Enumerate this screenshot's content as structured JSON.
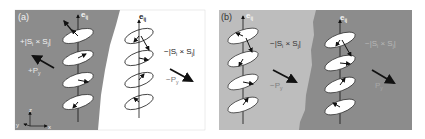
{
  "figure": {
    "panels": [
      {
        "id": "a",
        "label": "(a)",
        "axis_label": "e",
        "axis_sub": "ij",
        "left_region": {
          "color": "#8c8c8c",
          "chirality_label": "+|S",
          "chirality_sub1": "i",
          "chirality_mid": " × S",
          "chirality_sub2": "j",
          "chirality_end": "|",
          "polarization_label": "+P",
          "polarization_sub": "y"
        },
        "right_region": {
          "color": "#ffffff",
          "chirality_label": "−|S",
          "chirality_sub1": "i",
          "chirality_mid": " × S",
          "chirality_sub2": "j",
          "chirality_end": "|",
          "polarization_label": "−P",
          "polarization_sub": "y"
        },
        "axes": {
          "z": "z",
          "y": "y",
          "x": "x"
        }
      },
      {
        "id": "b",
        "label": "(b)",
        "axis_label": "e",
        "axis_sub": "ij",
        "left_region": {
          "color": "#bdbdbd",
          "chirality_label": "−|S",
          "chirality_sub1": "i",
          "chirality_mid": " × S",
          "chirality_sub2": "j",
          "chirality_end": "|",
          "polarization_label": "−P",
          "polarization_sub": "y"
        },
        "right_region": {
          "color": "#8c8c8c",
          "chirality_label": "−|S",
          "chirality_sub1": "i",
          "chirality_mid": " × S",
          "chirality_sub2": "j",
          "chirality_end": "|",
          "polarization_label": "P",
          "polarization_sub": "y"
        }
      }
    ]
  }
}
